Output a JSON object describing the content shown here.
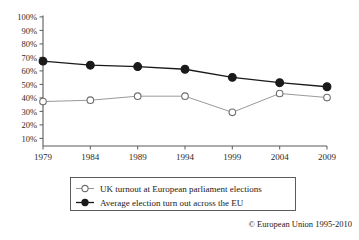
{
  "chart_data": {
    "type": "line",
    "title": "",
    "xlabel": "",
    "ylabel": "",
    "categories": [
      "1979",
      "1984",
      "1989",
      "1994",
      "1999",
      "2004",
      "2009"
    ],
    "x": [
      1979,
      1984,
      1989,
      1994,
      1999,
      2004,
      2009
    ],
    "ylim": [
      0,
      100
    ],
    "ytick_values": [
      10,
      20,
      30,
      40,
      50,
      60,
      70,
      80,
      90,
      100
    ],
    "ytick_labels": [
      "10%",
      "20%",
      "30%",
      "40%",
      "50%",
      "60%",
      "70%",
      "80%",
      "90%",
      "100%"
    ],
    "xtick_labels": [
      "1979",
      "1984",
      "1989",
      "1994",
      "1999",
      "2004",
      "2009"
    ],
    "grid": false,
    "legend_position": "bottom",
    "series": [
      {
        "name": "UK turnout at European parliament elections",
        "marker": "open-circle",
        "color": "#9a9a9a",
        "values": [
          33,
          34,
          37,
          37,
          25,
          39,
          36
        ]
      },
      {
        "name": "Average election turn out across the EU",
        "marker": "filled-circle",
        "color": "#1a1a1a",
        "values": [
          63,
          60,
          59,
          57,
          51,
          47,
          44
        ]
      }
    ],
    "annotations": [
      "© European Union 1995-2010"
    ]
  },
  "legend": {
    "items": [
      {
        "label": "UK turnout at European parliament elections",
        "marker": "open-circle-marker"
      },
      {
        "label": "Average election turn out across the EU",
        "marker": "filled-circle-marker"
      }
    ]
  },
  "credit": {
    "text": "© European Union 1995-2010"
  }
}
